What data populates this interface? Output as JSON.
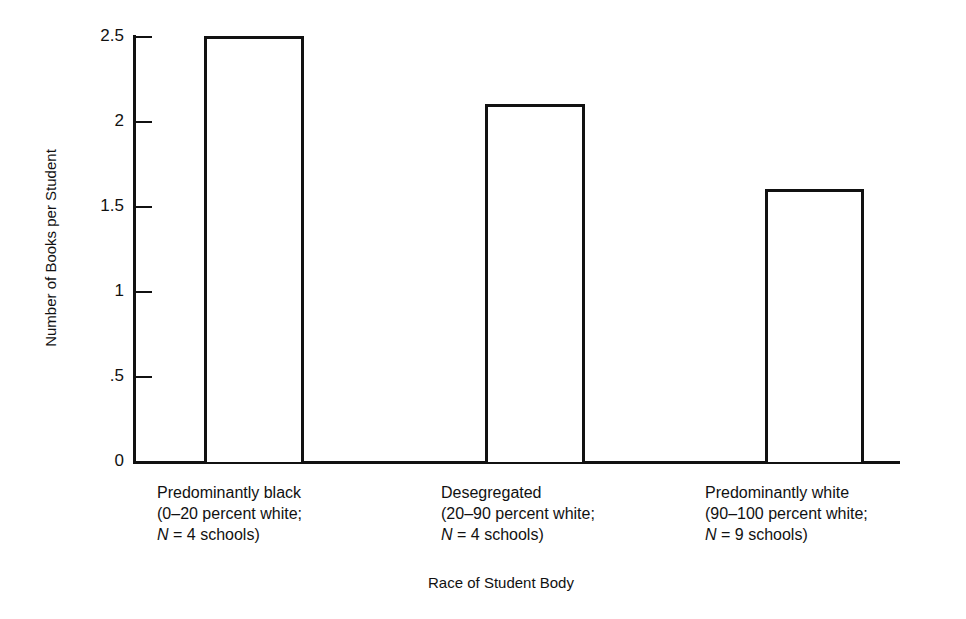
{
  "chart_data": {
    "type": "bar",
    "title": "",
    "xlabel": "Race of Student Body",
    "ylabel": "Number of Books per Student",
    "ylim": [
      0,
      2.5
    ],
    "yticks": [
      0,
      0.5,
      1,
      1.5,
      2,
      2.5
    ],
    "ytick_labels": [
      "0",
      ".5",
      "1",
      "1.5",
      "2",
      "2.5"
    ],
    "grid": false,
    "legend": null,
    "categories": [
      "Predominantly black (0–20 percent white; N = 4 schools)",
      "Desegregated (20–90 percent white; N = 4 schools)",
      "Predominantly white (90–100 percent white; N = 9 schools)"
    ],
    "values": [
      2.5,
      2.1,
      1.6
    ]
  },
  "axis": {
    "ylabel": "Number of Books per Student",
    "xlabel": "Race of Student Body",
    "ticks": [
      {
        "label": "2.5",
        "value": 2.5
      },
      {
        "label": "2",
        "value": 2
      },
      {
        "label": "1.5",
        "value": 1.5
      },
      {
        "label": "1",
        "value": 1
      },
      {
        "label": ".5",
        "value": 0.5
      },
      {
        "label": "0",
        "value": 0
      }
    ]
  },
  "categories": [
    {
      "line1": "Predominantly black",
      "line2": "(0–20 percent white;",
      "n": "N",
      "line3": " = 4 schools)",
      "value": 2.5
    },
    {
      "line1": "Desegregated",
      "line2": "(20–90 percent white;",
      "n": "N",
      "line3": " = 4 schools)",
      "value": 2.1
    },
    {
      "line1": "Predominantly white",
      "line2": "(90–100 percent white;",
      "n": "N",
      "line3": " = 9 schools)",
      "value": 1.6
    }
  ]
}
